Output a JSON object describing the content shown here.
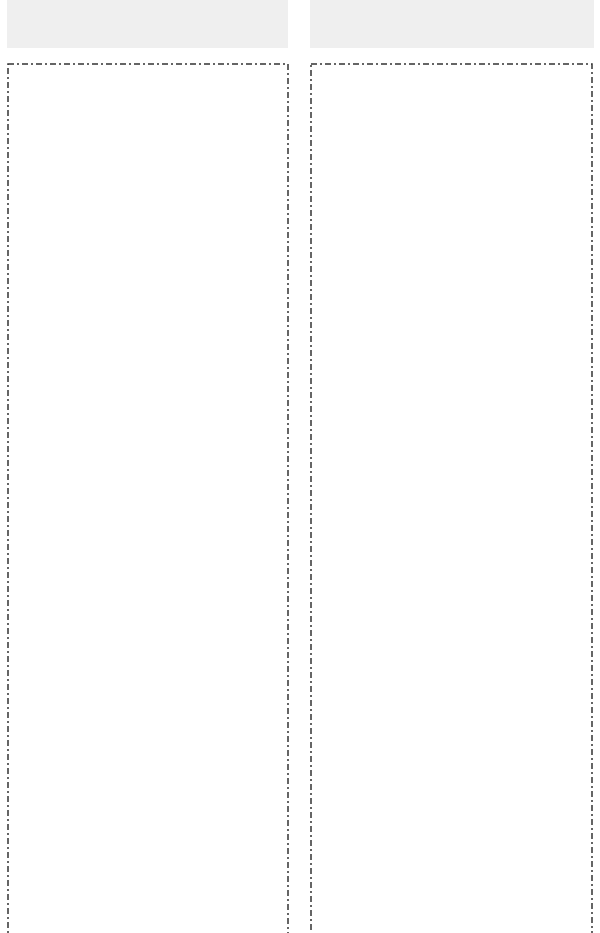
{
  "layout": {
    "columns": [
      {
        "id": "left",
        "header": {
          "label": ""
        },
        "content": {
          "items": []
        }
      },
      {
        "id": "right",
        "header": {
          "label": ""
        },
        "content": {
          "items": []
        }
      }
    ]
  },
  "colors": {
    "background": "#ffffff",
    "header_bar": "#efefef",
    "dash_border": "#333333"
  }
}
